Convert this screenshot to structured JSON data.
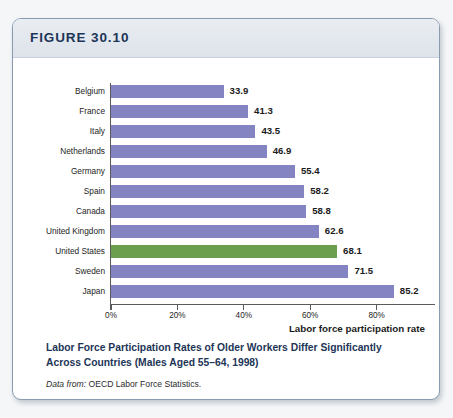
{
  "figure": {
    "number_label": "FIGURE 30.10",
    "caption_title": "Labor Force Participation Rates of Older Workers Differ Significantly Across Countries (Males Aged 55–64, 1998)",
    "source_prefix": "Data from:",
    "source_text": "OECD Labor Force Statistics."
  },
  "colors": {
    "bar": "#8484c2",
    "highlight_bar": "#6c9f4d",
    "header_text": "#1d3557",
    "axis": "#5a5a5a"
  },
  "chart_data": {
    "type": "bar",
    "orientation": "horizontal",
    "title": "Labor Force Participation Rates of Older Workers Differ Significantly Across Countries (Males Aged 55–64, 1998)",
    "xlabel": "Labor force participation rate",
    "ylabel": "",
    "xlim": [
      0,
      90
    ],
    "xticks": [
      0,
      20,
      40,
      60,
      80
    ],
    "xtick_labels": [
      "0%",
      "20%",
      "40%",
      "60%",
      "80%"
    ],
    "grid": false,
    "legend": false,
    "categories": [
      "Belgium",
      "France",
      "Italy",
      "Netherlands",
      "Germany",
      "Spain",
      "Canada",
      "United Kingdom",
      "United States",
      "Sweden",
      "Japan"
    ],
    "values": [
      33.9,
      41.3,
      43.5,
      46.9,
      55.4,
      58.2,
      58.8,
      62.6,
      68.1,
      71.5,
      85.2
    ],
    "value_labels": [
      "33.9",
      "41.3",
      "43.5",
      "46.9",
      "55.4",
      "58.2",
      "58.8",
      "62.6",
      "68.1",
      "71.5",
      "85.2"
    ],
    "highlighted_category": "United States"
  }
}
